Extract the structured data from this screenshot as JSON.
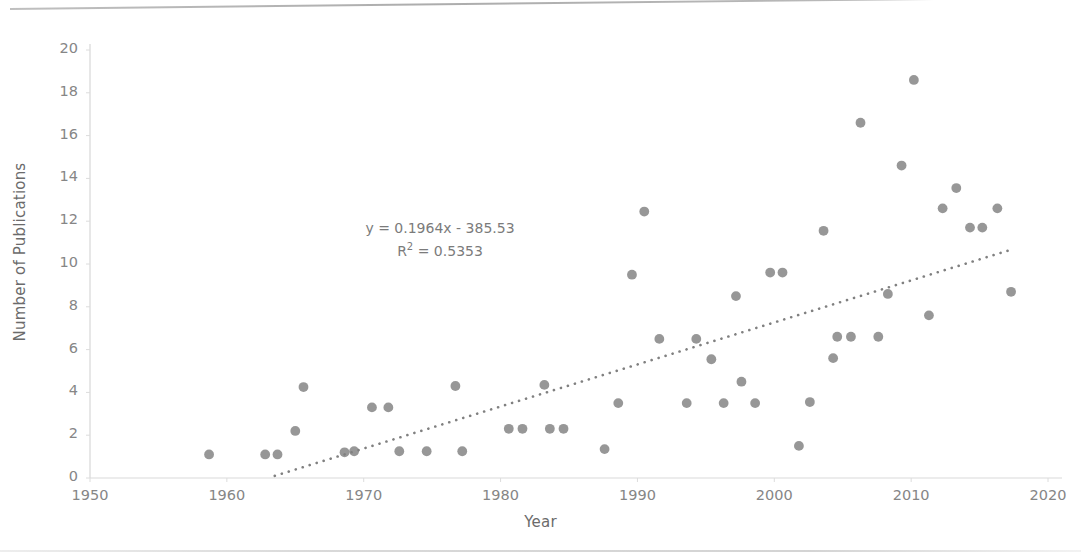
{
  "chart_data": {
    "type": "scatter",
    "title": "",
    "xlabel": "Year",
    "ylabel": "Number of Publications",
    "xlim": [
      1950,
      2020
    ],
    "ylim": [
      0,
      20
    ],
    "xticks": [
      1950,
      1960,
      1970,
      1980,
      1990,
      2000,
      2010,
      2020
    ],
    "yticks": [
      0,
      2,
      4,
      6,
      8,
      10,
      12,
      14,
      16,
      18,
      20
    ],
    "grid": false,
    "legend": "none",
    "marker_color": "#808080",
    "trendline_color": "#808080",
    "trendline_style": "dotted",
    "annotations": {
      "equation": "y = 0.1964x - 385.53",
      "r_squared_label": "R",
      "r_squared_sup": "2",
      "r_squared_value": "= 0.5353"
    },
    "trendline": {
      "slope": 0.1964,
      "intercept": -385.53,
      "r_squared": 0.5353,
      "x_start": 1963.5,
      "x_end": 2017.5
    },
    "points": [
      {
        "x": 1958.7,
        "y": 1.1
      },
      {
        "x": 1962.8,
        "y": 1.1
      },
      {
        "x": 1963.7,
        "y": 1.1
      },
      {
        "x": 1965.0,
        "y": 2.2
      },
      {
        "x": 1965.6,
        "y": 4.25
      },
      {
        "x": 1968.6,
        "y": 1.2
      },
      {
        "x": 1969.3,
        "y": 1.25
      },
      {
        "x": 1970.6,
        "y": 3.3
      },
      {
        "x": 1971.8,
        "y": 3.3
      },
      {
        "x": 1972.6,
        "y": 1.25
      },
      {
        "x": 1974.6,
        "y": 1.25
      },
      {
        "x": 1976.7,
        "y": 4.3
      },
      {
        "x": 1977.2,
        "y": 1.25
      },
      {
        "x": 1980.6,
        "y": 2.3
      },
      {
        "x": 1981.6,
        "y": 2.3
      },
      {
        "x": 1983.2,
        "y": 4.35
      },
      {
        "x": 1983.6,
        "y": 2.3
      },
      {
        "x": 1984.6,
        "y": 2.3
      },
      {
        "x": 1987.6,
        "y": 1.35
      },
      {
        "x": 1988.6,
        "y": 3.5
      },
      {
        "x": 1989.6,
        "y": 9.5
      },
      {
        "x": 1990.5,
        "y": 12.45
      },
      {
        "x": 1991.6,
        "y": 6.5
      },
      {
        "x": 1993.6,
        "y": 3.5
      },
      {
        "x": 1994.3,
        "y": 6.5
      },
      {
        "x": 1995.4,
        "y": 5.55
      },
      {
        "x": 1996.3,
        "y": 3.5
      },
      {
        "x": 1997.2,
        "y": 8.5
      },
      {
        "x": 1997.6,
        "y": 4.5
      },
      {
        "x": 1998.6,
        "y": 3.5
      },
      {
        "x": 1999.7,
        "y": 9.6
      },
      {
        "x": 2000.6,
        "y": 9.6
      },
      {
        "x": 2001.8,
        "y": 1.5
      },
      {
        "x": 2002.6,
        "y": 3.55
      },
      {
        "x": 2003.6,
        "y": 11.55
      },
      {
        "x": 2004.3,
        "y": 5.6
      },
      {
        "x": 2004.6,
        "y": 6.6
      },
      {
        "x": 2005.6,
        "y": 6.6
      },
      {
        "x": 2006.3,
        "y": 16.6
      },
      {
        "x": 2007.6,
        "y": 6.6
      },
      {
        "x": 2008.3,
        "y": 8.6
      },
      {
        "x": 2009.3,
        "y": 14.6
      },
      {
        "x": 2010.2,
        "y": 18.6
      },
      {
        "x": 2011.3,
        "y": 7.6
      },
      {
        "x": 2012.3,
        "y": 12.6
      },
      {
        "x": 2013.3,
        "y": 13.55
      },
      {
        "x": 2014.3,
        "y": 11.7
      },
      {
        "x": 2015.2,
        "y": 11.7
      },
      {
        "x": 2016.3,
        "y": 12.6
      },
      {
        "x": 2017.3,
        "y": 8.7
      }
    ]
  }
}
